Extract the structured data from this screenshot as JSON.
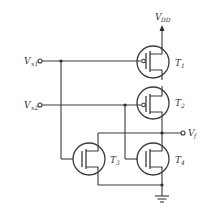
{
  "diagram": {
    "type": "CMOS logic gate schematic",
    "supply": {
      "label": "V",
      "sub": "DD"
    },
    "inputs": [
      {
        "label": "V",
        "sub": "x1"
      },
      {
        "label": "V",
        "sub": "x2"
      }
    ],
    "output": {
      "label": "V",
      "sub": "f"
    },
    "transistors": [
      {
        "label": "T",
        "sub": "1",
        "type": "PMOS"
      },
      {
        "label": "T",
        "sub": "2",
        "type": "PMOS"
      },
      {
        "label": "T",
        "sub": "3",
        "type": "NMOS"
      },
      {
        "label": "T",
        "sub": "4",
        "type": "NMOS"
      }
    ],
    "ground": "ground-symbol"
  }
}
